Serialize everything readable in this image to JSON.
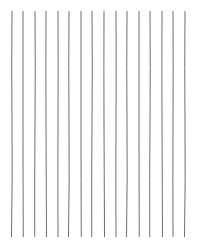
{
  "canvas": {
    "width": 201,
    "height": 249,
    "background": "#ffffff"
  },
  "lines": {
    "count": 16,
    "color": "#6e6e6e",
    "stroke_width": 1,
    "y_start": 11,
    "y_end": 237,
    "x_positions": [
      12,
      23,
      35,
      46,
      58,
      69,
      81,
      92,
      104,
      116,
      127,
      139,
      150,
      162,
      173,
      185
    ]
  }
}
